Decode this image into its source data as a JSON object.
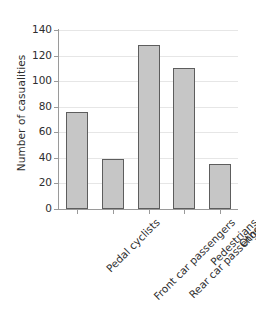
{
  "chart_data": {
    "type": "bar",
    "title": "",
    "subtitle": "",
    "xlabel": "",
    "ylabel": "Number of casualities",
    "categories": [
      "Pedal cyclists",
      "Front car passengers",
      "Rear car passengers",
      "Pedestrians",
      "Others"
    ],
    "values": [
      76,
      39,
      128,
      110,
      35
    ],
    "ylim": [
      0,
      140
    ],
    "yticks": [
      0,
      20,
      40,
      60,
      80,
      100,
      120,
      140
    ],
    "ytick_labels": [
      "0",
      "20",
      "40",
      "60",
      "80",
      "100",
      "120",
      "140"
    ],
    "grid": "horizontal",
    "legend": "none",
    "series": [
      {
        "name": "Number of casualities",
        "values": [
          76,
          39,
          128,
          110,
          35
        ]
      }
    ],
    "colors": {
      "bar_fill": "#c6c6c6",
      "bar_edge": "#5d5d5d",
      "grid": "#e6e6e6",
      "axis": "#9a9a9a",
      "text": "#2e2e2e",
      "background": "#ffffff"
    }
  }
}
